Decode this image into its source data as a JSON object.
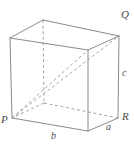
{
  "figure": {
    "kind": "rectangular-box-diagram",
    "width": 134,
    "height": 145,
    "background_color": "#ffffff",
    "solid_edge_color": "#8a8a8a",
    "hidden_edge_color": "#9a9a9a",
    "label_color": "#4a4a4a"
  },
  "vertex_labels": {
    "p": "P",
    "q": "Q",
    "r": "R"
  },
  "edge_labels": {
    "a": "a",
    "b": "b",
    "c": "c"
  },
  "geometry": {
    "front_bottom_left": [
      12,
      118
    ],
    "front_bottom_right": [
      88,
      131
    ],
    "right_bottom_back": [
      118,
      118
    ],
    "back_bottom_hidden": [
      44,
      103
    ],
    "front_top_left": [
      10,
      38
    ],
    "front_top_right": [
      88,
      50
    ],
    "right_top_back": [
      119,
      36
    ],
    "back_top_hidden": [
      43,
      20
    ]
  }
}
